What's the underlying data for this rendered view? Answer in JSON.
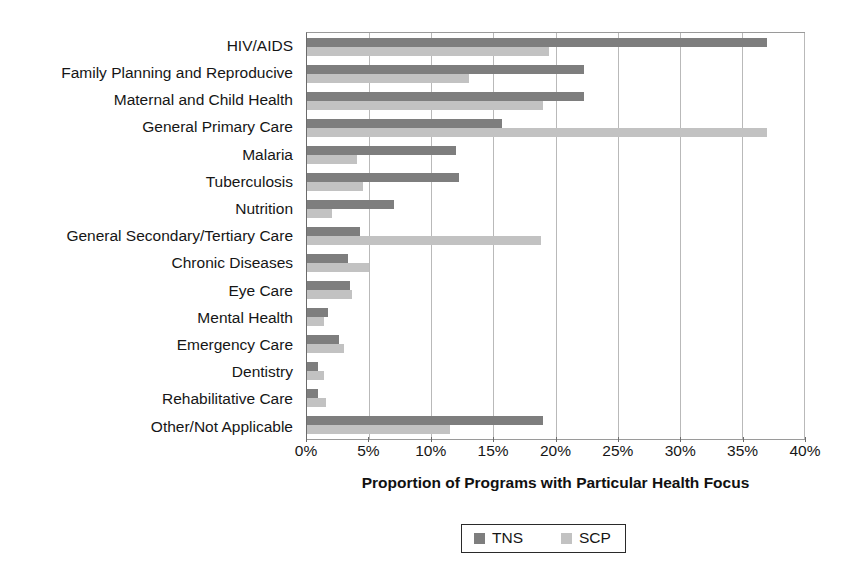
{
  "chart_data": {
    "type": "bar",
    "orientation": "horizontal",
    "title": "",
    "xlabel": "Proportion of Programs with Particular Health Focus",
    "ylabel": "",
    "xlim": [
      0,
      40
    ],
    "xtick_labels": [
      "0%",
      "5%",
      "10%",
      "15%",
      "20%",
      "25%",
      "30%",
      "35%",
      "40%"
    ],
    "xticks": [
      0,
      5,
      10,
      15,
      20,
      25,
      30,
      35,
      40
    ],
    "grid": true,
    "legend_position": "bottom",
    "categories": [
      "HIV/AIDS",
      "Family Planning and Reproducive",
      "Maternal and Child Health",
      "General Primary Care",
      "Malaria",
      "Tuberculosis",
      "Nutrition",
      "General Secondary/Tertiary Care",
      "Chronic Diseases",
      "Eye Care",
      "Mental Health",
      "Emergency Care",
      "Dentistry",
      "Rehabilitative Care",
      "Other/Not Applicable"
    ],
    "series": [
      {
        "name": "TNS",
        "color": "#7e7e7e",
        "values": [
          37.0,
          22.3,
          22.3,
          15.7,
          12.0,
          12.2,
          7.0,
          4.3,
          3.3,
          3.5,
          1.7,
          2.6,
          0.9,
          0.9,
          19.0
        ]
      },
      {
        "name": "SCP",
        "color": "#c2c2c2",
        "values": [
          19.5,
          13.0,
          19.0,
          37.0,
          4.0,
          4.5,
          2.0,
          18.8,
          5.0,
          3.6,
          1.4,
          3.0,
          1.4,
          1.5,
          11.5
        ]
      }
    ]
  },
  "legend": {
    "entries": [
      {
        "label": "TNS",
        "swatch": "series-tns"
      },
      {
        "label": "SCP",
        "swatch": "series-scp"
      }
    ]
  }
}
